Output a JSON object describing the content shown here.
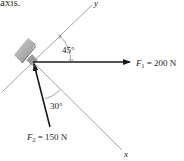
{
  "caption": {
    "text": "axis."
  },
  "axes": {
    "x": {
      "label": "x"
    },
    "y": {
      "label": "y"
    }
  },
  "forces": [
    {
      "name": "F1",
      "symbol": "F",
      "subscript": "1",
      "equals": " = 200 N",
      "magnitude": 200,
      "unit": "N",
      "direction": "horizontal right"
    },
    {
      "name": "F2",
      "symbol": "F",
      "subscript": "2",
      "equals": " = 150 N",
      "magnitude": 150,
      "unit": "N",
      "direction": "toward origin from lower right"
    }
  ],
  "angles": [
    {
      "label": "45°",
      "between": "y-axis and F1"
    },
    {
      "label": "30°",
      "between": "x-axis and F2"
    }
  ],
  "colors": {
    "axis_line": "#8a8a8a",
    "force_arrow": "#1a1a1a",
    "support_hatch": "#7a7a7a",
    "text": "#222222"
  }
}
